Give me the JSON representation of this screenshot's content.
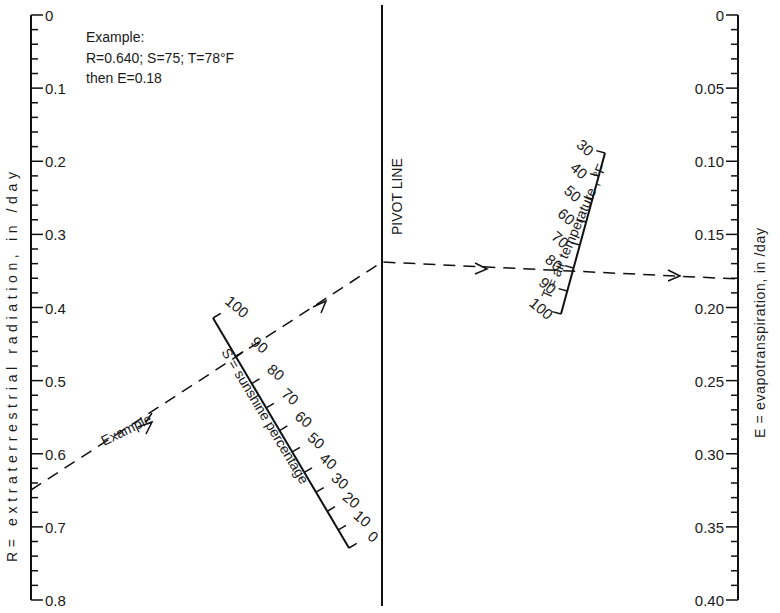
{
  "chart_data": {
    "type": "nomograph",
    "title": "",
    "example": {
      "heading": "Example:",
      "line1": "R=0.640;  S=75;  T=78°F",
      "line2": "then  E=0.18",
      "inputs": {
        "R": 0.64,
        "S": 75,
        "T": 78
      },
      "result": {
        "E": 0.18
      },
      "path_label": "Example"
    },
    "scales": [
      {
        "id": "R",
        "label": "R= extraterrestrial  radiation,  in /day",
        "range": [
          0,
          0.8
        ],
        "major_ticks": [
          "0",
          "0.1",
          "0.2",
          "0.3",
          "0.4",
          "0.5",
          "0.6",
          "0.7",
          "0.8"
        ],
        "minor_step": 0.02,
        "orientation": "vertical-left"
      },
      {
        "id": "S",
        "label": "S = sunshine  percentage",
        "range": [
          0,
          100
        ],
        "major_ticks": [
          "100",
          "90",
          "80",
          "70",
          "60",
          "50",
          "40",
          "30",
          "20",
          "10",
          "0"
        ],
        "orientation": "oblique"
      },
      {
        "id": "pivot",
        "label": "PIVOT LINE",
        "orientation": "vertical-center"
      },
      {
        "id": "T",
        "label": "T = air temperature , °F",
        "range": [
          30,
          100
        ],
        "major_ticks": [
          "30",
          "40",
          "50",
          "60",
          "70",
          "80",
          "90",
          "100"
        ],
        "orientation": "oblique"
      },
      {
        "id": "E",
        "label": "E = evapotranspiration,  in /day",
        "range": [
          0,
          0.4
        ],
        "major_ticks": [
          "0",
          "0.05",
          "0.10",
          "0.15",
          "0.20",
          "0.25",
          "0.30",
          "0.35",
          "0.40"
        ],
        "minor_step": 0.01,
        "orientation": "vertical-right"
      }
    ]
  }
}
